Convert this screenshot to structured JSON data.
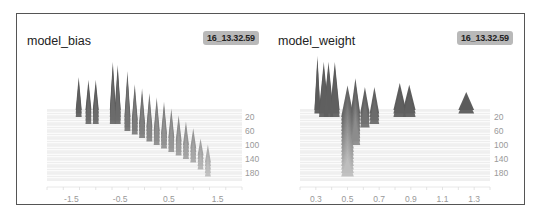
{
  "panels": [
    {
      "title": "model_bias",
      "run_badge": "16_13.32.59"
    },
    {
      "title": "model_weight",
      "run_badge": "16_13.32.59"
    }
  ],
  "chart_data": [
    {
      "type": "histogram-offset",
      "title": "model_bias",
      "run": "16_13.32.59",
      "x_ticks": [
        "-1.5",
        "-0.5",
        "0.5",
        "1.5"
      ],
      "x_tick_values": [
        -1.5,
        -0.5,
        0.5,
        1.5
      ],
      "xlim": [
        -2.0,
        2.0
      ],
      "y_ticks": [
        "20",
        "60",
        "100",
        "140",
        "180"
      ],
      "y_label": "step",
      "ylim": [
        0,
        200
      ],
      "grid": true,
      "description": "Stacked per-step histograms of bias values; one bias starts near -1.3 and stays, others drift from ~-0.6..0.8 toward ~1.3 as steps increase",
      "peaks": [
        {
          "x": -1.35,
          "step_start": 0,
          "step_end": 20,
          "height": 0.55
        },
        {
          "x": -1.15,
          "step_start": 0,
          "step_end": 40,
          "height": 0.5
        },
        {
          "x": -1.0,
          "step_start": 0,
          "step_end": 40,
          "height": 0.5
        },
        {
          "x": -0.65,
          "step_start": 0,
          "step_end": 40,
          "height": 0.8
        },
        {
          "x": -0.55,
          "step_start": 0,
          "step_end": 40,
          "height": 0.75
        },
        {
          "x": -0.35,
          "step_start": 20,
          "step_end": 60,
          "height": 0.8
        },
        {
          "x": -0.2,
          "step_start": 30,
          "step_end": 70,
          "height": 0.65
        },
        {
          "x": -0.05,
          "step_start": 40,
          "step_end": 80,
          "height": 0.65
        },
        {
          "x": 0.1,
          "step_start": 50,
          "step_end": 90,
          "height": 0.65
        },
        {
          "x": 0.25,
          "step_start": 60,
          "step_end": 100,
          "height": 0.65
        },
        {
          "x": 0.4,
          "step_start": 70,
          "step_end": 110,
          "height": 0.65
        },
        {
          "x": 0.55,
          "step_start": 80,
          "step_end": 120,
          "height": 0.6
        },
        {
          "x": 0.7,
          "step_start": 90,
          "step_end": 130,
          "height": 0.55
        },
        {
          "x": 0.85,
          "step_start": 100,
          "step_end": 140,
          "height": 0.5
        },
        {
          "x": 1.0,
          "step_start": 110,
          "step_end": 150,
          "height": 0.45
        },
        {
          "x": 1.15,
          "step_start": 130,
          "step_end": 170,
          "height": 0.4
        },
        {
          "x": 1.3,
          "step_start": 150,
          "step_end": 190,
          "height": 0.45
        }
      ]
    },
    {
      "type": "histogram-offset",
      "title": "model_weight",
      "run": "16_13.32.59",
      "x_ticks": [
        "0.3",
        "0.5",
        "0.7",
        "0.9",
        "1.1",
        "1.3"
      ],
      "x_tick_values": [
        0.3,
        0.5,
        0.7,
        0.9,
        1.1,
        1.3
      ],
      "xlim": [
        0.2,
        1.4
      ],
      "y_ticks": [
        "20",
        "60",
        "100",
        "140",
        "180"
      ],
      "y_label": "step",
      "ylim": [
        0,
        200
      ],
      "grid": true,
      "description": "Stacked per-step histograms of weights; clusters near 0.3, 0.35-0.42, 0.55-0.7, 0.82-0.9 and 1.25; a band near 0.5 extends through all steps",
      "peaks": [
        {
          "x": 0.31,
          "step_start": 0,
          "step_end": 10,
          "height": 0.9,
          "width": 0.01
        },
        {
          "x": 0.35,
          "step_start": 0,
          "step_end": 20,
          "height": 0.8,
          "width": 0.03
        },
        {
          "x": 0.38,
          "step_start": 0,
          "step_end": 20,
          "height": 0.8,
          "width": 0.03
        },
        {
          "x": 0.42,
          "step_start": 0,
          "step_end": 20,
          "height": 0.8,
          "width": 0.03
        },
        {
          "x": 0.5,
          "step_start": 20,
          "step_end": 190,
          "height": 0.55,
          "width": 0.04
        },
        {
          "x": 0.55,
          "step_start": 10,
          "step_end": 100,
          "height": 0.6,
          "width": 0.03
        },
        {
          "x": 0.61,
          "step_start": 10,
          "step_end": 50,
          "height": 0.45,
          "width": 0.03
        },
        {
          "x": 0.67,
          "step_start": 10,
          "step_end": 40,
          "height": 0.45,
          "width": 0.03
        },
        {
          "x": 0.83,
          "step_start": 0,
          "step_end": 20,
          "height": 0.45,
          "width": 0.04
        },
        {
          "x": 0.89,
          "step_start": 0,
          "step_end": 20,
          "height": 0.42,
          "width": 0.04
        },
        {
          "x": 1.25,
          "step_start": 0,
          "step_end": 10,
          "height": 0.3,
          "width": 0.05
        }
      ]
    }
  ]
}
